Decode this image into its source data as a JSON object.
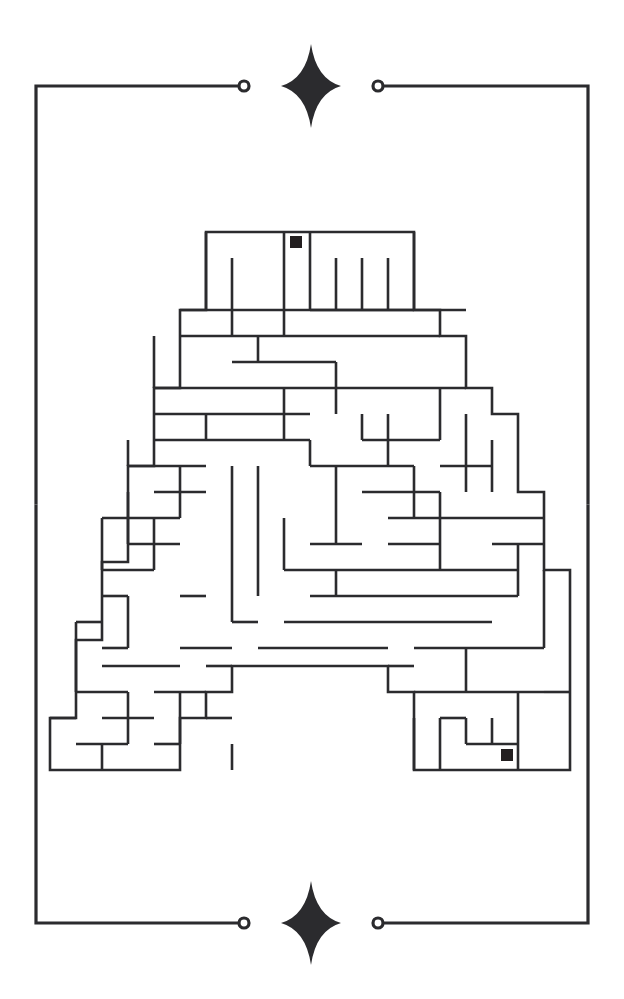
{
  "artwork": {
    "kind": "letter-maze-puzzle",
    "title": "Letter A Maze",
    "background_color": "#ffffff",
    "ink_color": "#2b2b2e",
    "marker_color": "#231f20",
    "canvas": {
      "width": 624,
      "height": 999
    }
  },
  "frame": {
    "name": "decorative-border",
    "stroke_color": "#2b2b2e",
    "stroke_width": 3.2,
    "rect": {
      "left": 36,
      "top": 86,
      "right": 588,
      "bottom": 923
    },
    "top_gap": {
      "left_x": 244,
      "right_x": 378
    },
    "bottom_gap": {
      "left_x": 244,
      "right_x": 378
    },
    "end_dots": [
      {
        "name": "top-left-dot",
        "cx": 244,
        "cy": 86,
        "r": 5
      },
      {
        "name": "top-right-dot",
        "cx": 378,
        "cy": 86,
        "r": 5
      },
      {
        "name": "bottom-left-dot",
        "cx": 244,
        "cy": 923,
        "r": 5
      },
      {
        "name": "bottom-right-dot",
        "cx": 378,
        "cy": 923,
        "r": 5
      }
    ],
    "sparkles": [
      {
        "name": "top-sparkle",
        "cx": 311,
        "cy": 86,
        "rx": 30,
        "ry": 42
      },
      {
        "name": "bottom-sparkle",
        "cx": 311,
        "cy": 923,
        "rx": 30,
        "ry": 42
      }
    ]
  },
  "maze": {
    "name": "letter-a-maze",
    "stroke_color": "#2b2b2e",
    "stroke_width": 2.6,
    "cell_size": 26,
    "origin": {
      "x": 50,
      "y": 232
    },
    "bounds": {
      "left": 50,
      "top": 232,
      "right": 570,
      "bottom": 770
    },
    "start_marker": {
      "name": "start-marker",
      "x": 290,
      "y": 236,
      "size": 12,
      "color": "#231f20"
    },
    "end_marker": {
      "name": "end-marker",
      "x": 501,
      "y": 749,
      "size": 12,
      "color": "#231f20"
    },
    "outline": "M206,232 L414,232 L414,310 L440,310 L440,336 L466,336 L466,388 L492,388 L492,414 L518,414 L518,492 L544,492 L544,570 L570,570 L570,770 L414,770 L414,692 L388,692 L388,666 L232,666 L232,692 L206,692 L206,718 L180,718 L180,770 L50,770 L50,718 L76,718 L76,640 L102,640 L102,562 L128,562 L128,466 L154,466 L154,388 L180,388 L180,310 L206,310 Z",
    "walls": [
      "M206,232 L206,310",
      "M284,232 L284,336",
      "M310,232 L310,258",
      "M414,232 L414,310",
      "M232,258 L232,336",
      "M310,258 L310,310",
      "M336,258 L336,310",
      "M362,258 L362,310",
      "M388,258 L388,310",
      "M180,310 L466,310",
      "M310,310 L414,310",
      "M180,336 L440,336",
      "M154,336 L154,388",
      "M258,336 L258,362",
      "M232,362 L336,362",
      "M336,362 L336,414",
      "M180,388 L466,388",
      "M154,388 L180,388",
      "M154,414 L310,414",
      "M206,414 L206,440",
      "M362,414 L362,440",
      "M284,388 L284,440",
      "M440,388 L440,440",
      "M128,440 L128,466",
      "M154,440 L310,440",
      "M310,440 L310,466",
      "M362,440 L440,440",
      "M388,414 L388,466",
      "M466,414 L466,492",
      "M128,466 L206,466",
      "M180,466 L180,518",
      "M232,466 L232,622",
      "M258,466 L258,596",
      "M336,466 L336,492",
      "M310,466 L414,466",
      "M414,466 L414,518",
      "M440,466 L492,466",
      "M492,440 L492,492",
      "M128,492 L128,544",
      "M154,492 L206,492",
      "M336,492 L336,544",
      "M362,492 L440,492",
      "M440,492 L440,570",
      "M102,518 L180,518",
      "M102,518 L102,570",
      "M154,518 L154,570",
      "M284,518 L284,570",
      "M466,518 L544,518",
      "M388,518 L466,518",
      "M388,544 L440,544",
      "M128,544 L180,544",
      "M310,544 L362,544",
      "M492,544 L544,544",
      "M102,570 L154,570",
      "M284,570 L518,570",
      "M336,570 L336,596",
      "M518,544 L518,596",
      "M102,596 L128,596",
      "M180,596 L206,596",
      "M310,596 L518,596",
      "M76,622 L102,622",
      "M128,596 L128,648",
      "M232,622 L258,622",
      "M284,622 L492,622",
      "M544,570 L544,648",
      "M76,622 L76,692",
      "M102,648 L128,648",
      "M180,648 L232,648",
      "M258,648 L388,648",
      "M414,648 L544,648",
      "M102,666 L180,666",
      "M206,666 L232,666",
      "M388,666 L414,666",
      "M466,648 L466,692",
      "M76,692 L128,692",
      "M154,692 L206,692",
      "M128,692 L128,744",
      "M180,692 L180,744",
      "M414,692 L544,692",
      "M440,718 L466,718",
      "M50,718 L76,718",
      "M102,718 L154,718",
      "M206,718 L232,718",
      "M414,718 L414,770",
      "M440,718 L440,770",
      "M466,718 L466,744",
      "M492,718 L492,744",
      "M518,692 L518,770",
      "M76,744 L128,744",
      "M154,744 L180,744",
      "M232,744 L232,770",
      "M466,744 L518,744",
      "M102,744 L102,770",
      "M544,692 L570,692"
    ]
  }
}
